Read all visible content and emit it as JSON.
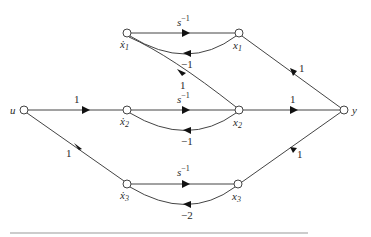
{
  "diagram": {
    "type": "signal-flow-graph",
    "nodes": {
      "u": "u",
      "x1dot": "ẋ1",
      "x1": "x1",
      "x2dot": "ẋ2",
      "x2": "x2",
      "x3dot": "ẋ3",
      "x3": "x3",
      "y": "y"
    },
    "node_labels": {
      "u": {
        "base": "u",
        "sub": ""
      },
      "x1dot": {
        "base": "ẋ",
        "sub": "1"
      },
      "x1": {
        "base": "x",
        "sub": "1"
      },
      "x2dot": {
        "base": "ẋ",
        "sub": "2"
      },
      "x2": {
        "base": "x",
        "sub": "2"
      },
      "x3dot": {
        "base": "ẋ",
        "sub": "3"
      },
      "x3": {
        "base": "x",
        "sub": "3"
      },
      "y": {
        "base": "y",
        "sub": ""
      }
    },
    "edges": [
      {
        "from": "u",
        "to": "x2dot",
        "gain": "1"
      },
      {
        "from": "u",
        "to": "x3dot",
        "gain": "1"
      },
      {
        "from": "x1dot",
        "to": "x1",
        "gain": "s^-1"
      },
      {
        "from": "x1",
        "to": "x1dot",
        "gain": "-1"
      },
      {
        "from": "x2",
        "to": "x1dot",
        "gain": "1"
      },
      {
        "from": "x2dot",
        "to": "x2",
        "gain": "s^-1"
      },
      {
        "from": "x2",
        "to": "x2dot",
        "gain": "-1"
      },
      {
        "from": "x3dot",
        "to": "x3",
        "gain": "s^-1"
      },
      {
        "from": "x3",
        "to": "x3dot",
        "gain": "-2"
      },
      {
        "from": "x1",
        "to": "y",
        "gain": "1"
      },
      {
        "from": "x2",
        "to": "y",
        "gain": "1"
      },
      {
        "from": "x3",
        "to": "y",
        "gain": "1"
      }
    ],
    "gain_labels": {
      "u_x2dot": "1",
      "u_x3dot": "1",
      "x1dot_x1_base": "s",
      "x1dot_x1_exp": "−1",
      "x1_x1dot": "−1",
      "x2_x1dot": "1",
      "x2dot_x2_base": "s",
      "x2dot_x2_exp": "−1",
      "x2_x2dot": "−1",
      "x3dot_x3_base": "s",
      "x3dot_x3_exp": "−1",
      "x3_x3dot": "−2",
      "x1_y": "1",
      "x2_y": "1",
      "x3_y": "1"
    }
  }
}
